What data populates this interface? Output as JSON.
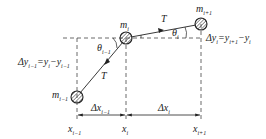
{
  "diagram": {
    "type": "string-mass-chain",
    "masses": [
      {
        "id": "m_prev",
        "label": "m",
        "sub": "i−1"
      },
      {
        "id": "m_cur",
        "label": "m",
        "sub": "i"
      },
      {
        "id": "m_next",
        "label": "m",
        "sub": "i+1"
      }
    ],
    "tension_labels": [
      "T",
      "T"
    ],
    "angles": [
      {
        "label": "θ",
        "sub": "i−1"
      },
      {
        "label": "θ",
        "sub": "i"
      }
    ],
    "dy_right": {
      "lhs": "Δy",
      "lhs_sub": "i",
      "rhs1": "y",
      "rhs1_sub": "i+1",
      "rhs2": "y",
      "rhs2_sub": "i"
    },
    "dy_left": {
      "lhs": "Δy",
      "lhs_sub": "i−1",
      "rhs1": "y",
      "rhs1_sub": "i",
      "rhs2": "y",
      "rhs2_sub": "i−1"
    },
    "dx": [
      {
        "label": "Δx",
        "sub": "i−1"
      },
      {
        "label": "Δx",
        "sub": "i"
      }
    ],
    "x_ticks": [
      {
        "label": "x",
        "sub": "i−1"
      },
      {
        "label": "x",
        "sub": "i"
      },
      {
        "label": "x",
        "sub": "i+1"
      }
    ]
  }
}
